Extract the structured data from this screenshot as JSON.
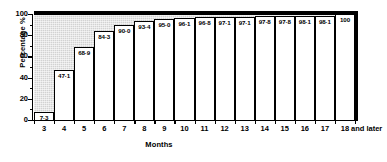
{
  "chart_data": {
    "type": "bar",
    "title": "",
    "xlabel": "Months",
    "ylabel": "Percentage %",
    "categories": [
      "3",
      "4",
      "5",
      "6",
      "7",
      "8",
      "9",
      "10",
      "11",
      "12",
      "13",
      "14",
      "15",
      "16",
      "17",
      "18 and later"
    ],
    "tail_note": "and later",
    "values": [
      7.3,
      47.1,
      68.9,
      84.3,
      90.0,
      93.4,
      95.0,
      96.1,
      96.8,
      97.1,
      97.1,
      97.8,
      97.8,
      98.1,
      98.1,
      100
    ],
    "value_labels": [
      "7·3",
      "47·1",
      "68·9",
      "84·3",
      "90·0",
      "93·4",
      "95·0",
      "96·1",
      "96·8",
      "97·1",
      "97·1",
      "97·8",
      "97·8",
      "98·1",
      "98·1",
      "100"
    ],
    "ylim": [
      0,
      100
    ],
    "xtick_labels": [
      "3",
      "4",
      "5",
      "6",
      "7",
      "8",
      "9",
      "10",
      "11",
      "12",
      "13",
      "14",
      "15",
      "16",
      "17",
      "18"
    ],
    "ytick_labels": [
      "0",
      "20",
      "40",
      "60",
      "80",
      "100"
    ],
    "ytick_values": [
      0,
      20,
      40,
      60,
      80,
      100
    ],
    "yminor_values": [
      10,
      30,
      50,
      70,
      90
    ],
    "grid": false,
    "legend": null,
    "colors": {
      "bar_fill": "#ffffff",
      "bar_edge": "#000000",
      "plot_background": "#d2d2d2",
      "axis": "#000000",
      "text": "#000000"
    }
  }
}
